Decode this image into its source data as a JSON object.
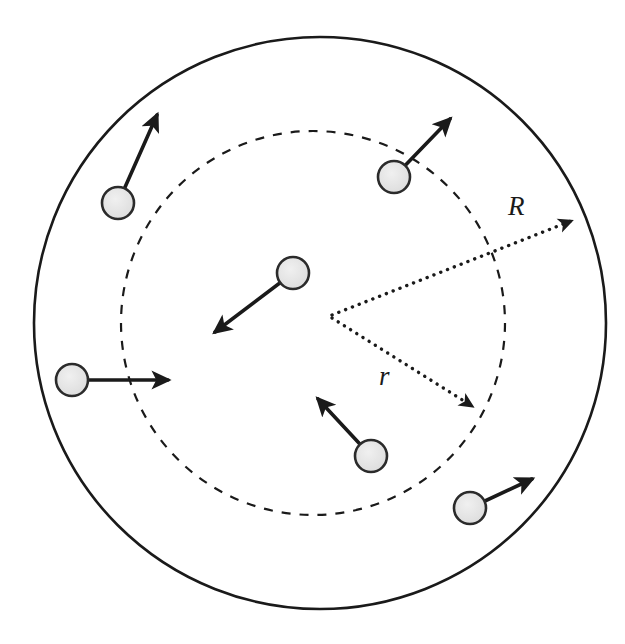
{
  "figure": {
    "type": "physics-schematic-diagram",
    "background_color": "#ffffff",
    "width": 625,
    "height": 644
  },
  "labels": [
    {
      "id": "label-R",
      "text": "R",
      "style": "italic-serif",
      "x": 508,
      "y": 215,
      "font_size": 27,
      "color": "#1a1a1a",
      "describes": "outer-solid-circle-radius"
    },
    {
      "id": "label-r",
      "text": "r",
      "style": "italic-serif",
      "x": 379,
      "y": 385,
      "font_size": 27,
      "color": "#1a1a1a",
      "describes": "inner-dashed-circle-radius"
    }
  ],
  "shapes": {
    "outer_circle": {
      "name": "outer-solid-circle",
      "cx": 320,
      "cy": 323,
      "r": 286,
      "stroke": "#1a1a1a",
      "stroke_width": 2.6,
      "stroke_style": "solid",
      "fill": "none"
    },
    "inner_circle": {
      "name": "inner-dashed-circle",
      "cx": 313,
      "cy": 323,
      "r": 192,
      "stroke": "#1a1a1a",
      "stroke_width": 2.2,
      "stroke_style": "dashed",
      "dash_pattern": "9 9",
      "fill": "none"
    }
  },
  "radius_arrows": [
    {
      "id": "radius-arrow-R",
      "label": "R",
      "style": "dotted",
      "from_x": 332,
      "from_y": 315,
      "to_x": 578,
      "to_y": 218,
      "stroke": "#1a1a1a",
      "stroke_width": 3.4,
      "dash_pattern": "0.1 7.2",
      "arrowhead": "filled-triangle",
      "endpoint_on": "outer-solid-circle"
    },
    {
      "id": "radius-arrow-r",
      "label": "r",
      "style": "dotted",
      "from_x": 332,
      "from_y": 318,
      "to_x": 478,
      "to_y": 410,
      "stroke": "#1a1a1a",
      "stroke_width": 3.4,
      "dash_pattern": "0.1 7.2",
      "arrowhead": "filled-triangle",
      "endpoint_on": "inner-dashed-circle"
    }
  ],
  "particles": [
    {
      "id": "particle-upper-left",
      "cx": 118,
      "cy": 203,
      "r": 16,
      "fill": "#e0e0e0",
      "stroke": "#2b2b2b",
      "stroke_width": 2.6,
      "region": "between-r-and-R",
      "velocity_arrow": {
        "to_x": 160,
        "to_y": 108,
        "stroke": "#1a1a1a",
        "stroke_width": 3.6,
        "direction": "up-right"
      }
    },
    {
      "id": "particle-upper-right",
      "cx": 394,
      "cy": 177,
      "r": 16,
      "fill": "#e0e0e0",
      "stroke": "#2b2b2b",
      "stroke_width": 2.6,
      "region": "on-inner-dashed-boundary",
      "velocity_arrow": {
        "to_x": 455,
        "to_y": 113,
        "stroke": "#1a1a1a",
        "stroke_width": 3.6,
        "direction": "up-right"
      }
    },
    {
      "id": "particle-center",
      "cx": 293,
      "cy": 273,
      "r": 16,
      "fill": "#e0e0e0",
      "stroke": "#2b2b2b",
      "stroke_width": 2.6,
      "region": "inside-r",
      "velocity_arrow": {
        "to_x": 208,
        "to_y": 338,
        "stroke": "#1a1a1a",
        "stroke_width": 3.6,
        "direction": "down-left"
      }
    },
    {
      "id": "particle-left",
      "cx": 72,
      "cy": 380,
      "r": 16,
      "fill": "#e0e0e0",
      "stroke": "#2b2b2b",
      "stroke_width": 2.6,
      "region": "between-r-and-R",
      "velocity_arrow": {
        "to_x": 176,
        "to_y": 380,
        "stroke": "#1a1a1a",
        "stroke_width": 3.6,
        "direction": "right"
      }
    },
    {
      "id": "particle-lower-center",
      "cx": 371,
      "cy": 456,
      "r": 16,
      "fill": "#e0e0e0",
      "stroke": "#2b2b2b",
      "stroke_width": 2.6,
      "region": "inside-r",
      "velocity_arrow": {
        "to_x": 312,
        "to_y": 392,
        "stroke": "#1a1a1a",
        "stroke_width": 3.6,
        "direction": "up-left"
      }
    },
    {
      "id": "particle-lower-right",
      "cx": 470,
      "cy": 508,
      "r": 16,
      "fill": "#e0e0e0",
      "stroke": "#2b2b2b",
      "stroke_width": 2.6,
      "region": "between-r-and-R",
      "velocity_arrow": {
        "to_x": 538,
        "to_y": 476,
        "stroke": "#1a1a1a",
        "stroke_width": 3.6,
        "direction": "up-right"
      }
    }
  ]
}
